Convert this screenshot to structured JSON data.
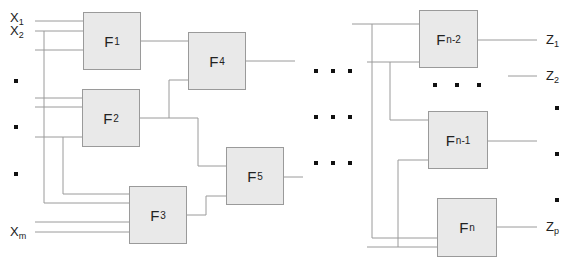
{
  "diagram": {
    "type": "combinational-logic-network",
    "colors": {
      "block_fill": "#e9e9e9",
      "block_border": "#9a9a9a",
      "wire": "#9a9a9a",
      "dot": "#111111"
    },
    "inputs": [
      {
        "id": "x1",
        "base": "X",
        "sub": "1"
      },
      {
        "id": "x2",
        "base": "X",
        "sub": "2"
      },
      {
        "id": "xm",
        "base": "X",
        "sub": "m"
      }
    ],
    "outputs": [
      {
        "id": "z1",
        "base": "Z",
        "sub": "1"
      },
      {
        "id": "z2",
        "base": "Z",
        "sub": "2"
      },
      {
        "id": "zp",
        "base": "Z",
        "sub": "p"
      }
    ],
    "blocks": [
      {
        "id": "f1",
        "base": "F",
        "sub": "1"
      },
      {
        "id": "f2",
        "base": "F",
        "sub": "2"
      },
      {
        "id": "f3",
        "base": "F",
        "sub": "3"
      },
      {
        "id": "f4",
        "base": "F",
        "sub": "4"
      },
      {
        "id": "f5",
        "base": "F",
        "sub": "5"
      },
      {
        "id": "fn2",
        "base": "F",
        "sub": "n-2"
      },
      {
        "id": "fn1",
        "base": "F",
        "sub": "n-1"
      },
      {
        "id": "fn",
        "base": "F",
        "sub": "n"
      }
    ],
    "ellipsis": {
      "input_column": "vertical dots between X2 and Xm",
      "middle": "three horizontal rows of three dots",
      "right_between_blocks": "three horizontal dots",
      "output_column": "vertical dots between Z2 and Zp"
    }
  }
}
